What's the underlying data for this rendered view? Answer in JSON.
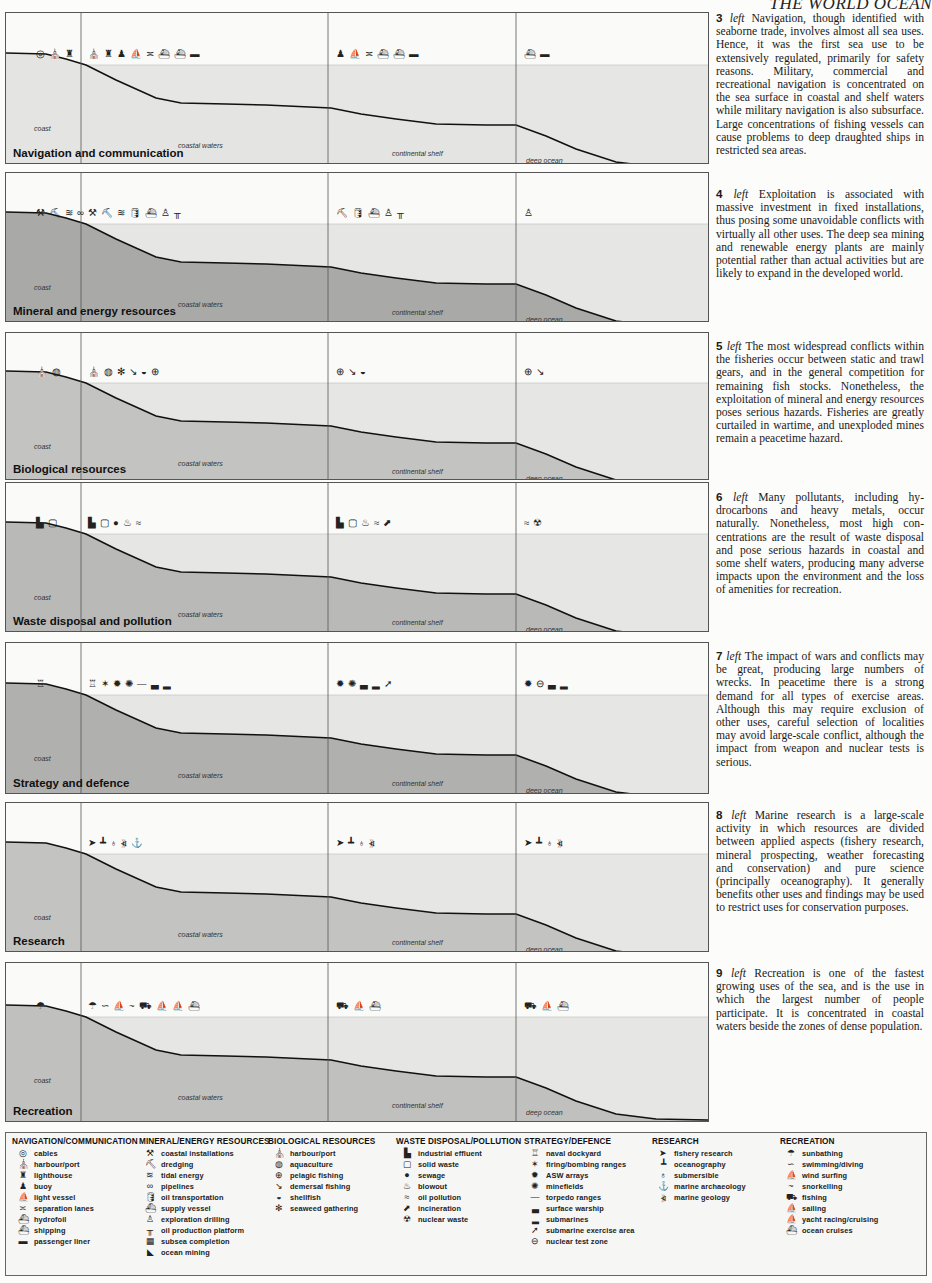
{
  "running_head": "THE WORLD OCEAN",
  "zones": {
    "coast": "coast",
    "coastal_waters": "coastal waters",
    "continental_shelf": "continental shelf",
    "deep_ocean": "deep ocean"
  },
  "panels": [
    {
      "title": "Navigation and communication",
      "seabed": "#f0f0ee"
    },
    {
      "title": "Mineral and energy resources",
      "seabed": "#a9a9a7"
    },
    {
      "title": "Biological resources",
      "seabed": "#c3c3c1"
    },
    {
      "title": "Waste disposal and pollution",
      "seabed": "#b9b9b7"
    },
    {
      "title": "Strategy and defence",
      "seabed": "#b0b0ae"
    },
    {
      "title": "Research",
      "seabed": "#c3c3c1"
    },
    {
      "title": "Recreation",
      "seabed": "#c0c0be"
    }
  ],
  "captions": [
    {
      "num": "3",
      "dir": "left",
      "text": "Navigation, though identified with seaborne trade, involves almost all sea uses. Hence, it was the first sea use to be extensively regulated, primarily for safety reasons. Military, commercial and recreational naviga­tion is concentrated on the sea surface in coastal and shelf waters while mili­tary navigation is also subsurface. Large concentrations of fishing vessels can cause problems to deep draughted ships in restricted sea areas."
    },
    {
      "num": "4",
      "dir": "left",
      "text": "Exploitation is associated with massive investment in fixed installa­tions, thus posing some unavoidable conflicts with virtually all other uses. The deep sea mining and renewable energy plants are mainly potential rather than actual activities but are likely to expand in the developed world."
    },
    {
      "num": "5",
      "dir": "left",
      "text": "The most widespread conflicts within the fisheries occur between static and trawl gears, and in the gen­eral competition for remaining fish stocks. Nonetheless, the exploitation of mineral and energy resources poses serious hazards. Fisheries are greatly curtailed in wartime, and unexploded mines remain a peacetime hazard."
    },
    {
      "num": "6",
      "dir": "left",
      "text": "Many pollutants, including hy­drocarbons and heavy metals, occur naturally. Nonetheless, most high con­centrations are the result of waste disposal and pose serious hazards in coastal and some shelf waters, produc­ing many adverse impacts upon the en­vironment and the loss of amenities for recreation."
    },
    {
      "num": "7",
      "dir": "left",
      "text": "The impact of wars and conflicts may be great, producing large numbers of wrecks. In peacetime there is a strong demand for all types of exercise areas. Although this may require exclu­sion of other uses, careful selection of localities may avoid large-scale conflict, although the impact from weapon and nuclear tests is serious."
    },
    {
      "num": "8",
      "dir": "left",
      "text": "Marine research is a large-scale activity in which resources are divided between applied aspects (fishery re­search, mineral prospecting, weather forecasting and conservation) and pure science (principally oceanography). It generally benefits other uses and find­ings may be used to restrict uses for conservation purposes."
    },
    {
      "num": "9",
      "dir": "left",
      "text": "Recreation is one of the fastest growing uses of the sea, and is the use in which the largest number of people participate. It is concentrated in coastal waters beside the zones of dense popu­lation."
    }
  ],
  "legend": [
    {
      "heading": "NAVIGATION/COMMUNICATION",
      "items": [
        {
          "icon": "cable-reel-icon",
          "label": "cables"
        },
        {
          "icon": "harbour-icon",
          "label": "harbour/port"
        },
        {
          "icon": "lighthouse-icon",
          "label": "lighthouse"
        },
        {
          "icon": "buoy-icon",
          "label": "buoy"
        },
        {
          "icon": "light-vessel-icon",
          "label": "light vessel"
        },
        {
          "icon": "separation-lanes-icon",
          "label": "separation lanes"
        },
        {
          "icon": "hydrofoil-icon",
          "label": "hydrofoil"
        },
        {
          "icon": "shipping-icon",
          "label": "shipping"
        },
        {
          "icon": "passenger-liner-icon",
          "label": "passenger liner"
        }
      ]
    },
    {
      "heading": "MINERAL/ENERGY RESOURCES",
      "items": [
        {
          "icon": "crane-icon",
          "label": "coastal installations"
        },
        {
          "icon": "dredger-icon",
          "label": "dredging"
        },
        {
          "icon": "tidal-icon",
          "label": "tidal energy"
        },
        {
          "icon": "pipeline-icon",
          "label": "pipelines"
        },
        {
          "icon": "oil-transport-icon",
          "label": "oil transportation"
        },
        {
          "icon": "supply-vessel-icon",
          "label": "supply vessel"
        },
        {
          "icon": "drill-rig-icon",
          "label": "exploration drilling"
        },
        {
          "icon": "platform-icon",
          "label": "oil production platform"
        },
        {
          "icon": "subsea-icon",
          "label": "subsea completion"
        },
        {
          "icon": "mining-icon",
          "label": "ocean mining"
        }
      ]
    },
    {
      "heading": "BIOLOGICAL RESOURCES",
      "items": [
        {
          "icon": "harbour-icon",
          "label": "harbour/port"
        },
        {
          "icon": "shell-icon",
          "label": "aquaculture"
        },
        {
          "icon": "net-icon",
          "label": "pelagic fishing"
        },
        {
          "icon": "trawl-icon",
          "label": "demersal fishing"
        },
        {
          "icon": "shellfish-icon",
          "label": "shellfish"
        },
        {
          "icon": "seaweed-icon",
          "label": "seaweed gathering"
        }
      ]
    },
    {
      "heading": "WASTE DISPOSAL/POLLUTION",
      "items": [
        {
          "icon": "factory-icon",
          "label": "industrial effluent"
        },
        {
          "icon": "waste-bag-icon",
          "label": "solid waste"
        },
        {
          "icon": "sewage-icon",
          "label": "sewage"
        },
        {
          "icon": "blowout-icon",
          "label": "blowout"
        },
        {
          "icon": "oil-slick-icon",
          "label": "oil pollution"
        },
        {
          "icon": "incineration-icon",
          "label": "incineration"
        },
        {
          "icon": "radiation-icon",
          "label": "nuclear waste"
        }
      ]
    },
    {
      "heading": "STRATEGY/DEFENCE",
      "items": [
        {
          "icon": "dockyard-icon",
          "label": "naval dockyard"
        },
        {
          "icon": "explosion-icon",
          "label": "firing/bombing ranges"
        },
        {
          "icon": "asw-icon",
          "label": "ASW arrays"
        },
        {
          "icon": "mine-icon",
          "label": "minefields"
        },
        {
          "icon": "torpedo-icon",
          "label": "torpedo ranges"
        },
        {
          "icon": "warship-icon",
          "label": "surface warship"
        },
        {
          "icon": "submarine-icon",
          "label": "submarines"
        },
        {
          "icon": "sub-exercise-icon",
          "label": "submarine exercise area"
        },
        {
          "icon": "nuclear-test-icon",
          "label": "nuclear test zone"
        }
      ]
    },
    {
      "heading": "RESEARCH",
      "items": [
        {
          "icon": "fish-icon",
          "label": "fishery research"
        },
        {
          "icon": "research-ship-icon",
          "label": "oceanography"
        },
        {
          "icon": "submersible-icon",
          "label": "submersible"
        },
        {
          "icon": "wreck-icon",
          "label": "marine archaeology"
        },
        {
          "icon": "sonar-icon",
          "label": "marine geology"
        }
      ]
    },
    {
      "heading": "RECREATION",
      "items": [
        {
          "icon": "umbrella-icon",
          "label": "sunbathing"
        },
        {
          "icon": "swimmer-icon",
          "label": "swimming/diving"
        },
        {
          "icon": "windsurf-icon",
          "label": "wind surfing"
        },
        {
          "icon": "snorkel-icon",
          "label": "snorkelling"
        },
        {
          "icon": "fishing-boat-icon",
          "label": "fishing"
        },
        {
          "icon": "sail-icon",
          "label": "sailing"
        },
        {
          "icon": "yacht-icon",
          "label": "yacht racing/cruising"
        },
        {
          "icon": "cruise-icon",
          "label": "ocean cruises"
        }
      ]
    }
  ],
  "glyphs": {
    "cable-reel-icon": "◎",
    "harbour-icon": "⛪",
    "lighthouse-icon": "♜",
    "buoy-icon": "♟",
    "light-vessel-icon": "⛵",
    "separation-lanes-icon": "≍",
    "hydrofoil-icon": "⛴",
    "shipping-icon": "⛴",
    "passenger-liner-icon": "▬",
    "crane-icon": "⚒",
    "dredger-icon": "⛏",
    "tidal-icon": "≋",
    "pipeline-icon": "∞",
    "oil-transport-icon": "🛢",
    "supply-vessel-icon": "⛴",
    "drill-rig-icon": "♙",
    "platform-icon": "╥",
    "subsea-icon": "▦",
    "mining-icon": "◣",
    "shell-icon": "◍",
    "net-icon": "⊕",
    "trawl-icon": "↘",
    "shellfish-icon": "◒",
    "seaweed-icon": "✻",
    "factory-icon": "▙",
    "waste-bag-icon": "▢",
    "sewage-icon": "●",
    "blowout-icon": "♨",
    "oil-slick-icon": "≈",
    "incineration-icon": "⬈",
    "radiation-icon": "☢",
    "dockyard-icon": "♖",
    "explosion-icon": "✶",
    "asw-icon": "✹",
    "mine-icon": "✺",
    "torpedo-icon": "—",
    "warship-icon": "▃",
    "submarine-icon": "▂",
    "sub-exercise-icon": "➚",
    "nuclear-test-icon": "⊖",
    "fish-icon": "➤",
    "research-ship-icon": "┻",
    "submersible-icon": "♁",
    "wreck-icon": "⚓",
    "sonar-icon": "⦖",
    "umbrella-icon": "☂",
    "swimmer-icon": "∽",
    "windsurf-icon": "⛵",
    "snorkel-icon": "~",
    "fishing-boat-icon": "⛟",
    "sail-icon": "⛵",
    "yacht-icon": "⛵",
    "cruise-icon": "⛴"
  },
  "panel_icons": [
    {
      "coast": [
        "cable-reel-icon",
        "harbour-icon",
        "lighthouse-icon"
      ],
      "coastal": [
        "harbour-icon",
        "lighthouse-icon",
        "buoy-icon",
        "light-vessel-icon",
        "separation-lanes-icon",
        "hydrofoil-icon",
        "shipping-icon",
        "passenger-liner-icon"
      ],
      "shelf": [
        "buoy-icon",
        "light-vessel-icon",
        "separation-lanes-icon",
        "hydrofoil-icon",
        "shipping-icon",
        "passenger-liner-icon"
      ],
      "deep": [
        "shipping-icon",
        "passenger-liner-icon"
      ]
    },
    {
      "coast": [
        "crane-icon",
        "dredger-icon",
        "tidal-icon",
        "pipeline-icon"
      ],
      "coastal": [
        "crane-icon",
        "dredger-icon",
        "tidal-icon",
        "oil-transport-icon",
        "supply-vessel-icon",
        "drill-rig-icon",
        "platform-icon"
      ],
      "shelf": [
        "dredger-icon",
        "oil-transport-icon",
        "supply-vessel-icon",
        "drill-rig-icon",
        "platform-icon"
      ],
      "deep": [
        "drill-rig-icon"
      ]
    },
    {
      "coast": [
        "harbour-icon",
        "shell-icon"
      ],
      "coastal": [
        "harbour-icon",
        "shell-icon",
        "seaweed-icon",
        "trawl-icon",
        "shellfish-icon",
        "net-icon"
      ],
      "shelf": [
        "net-icon",
        "trawl-icon",
        "shellfish-icon"
      ],
      "deep": [
        "net-icon",
        "trawl-icon"
      ]
    },
    {
      "coast": [
        "factory-icon",
        "waste-bag-icon"
      ],
      "coastal": [
        "factory-icon",
        "waste-bag-icon",
        "sewage-icon",
        "blowout-icon",
        "oil-slick-icon"
      ],
      "shelf": [
        "factory-icon",
        "waste-bag-icon",
        "blowout-icon",
        "oil-slick-icon",
        "incineration-icon"
      ],
      "deep": [
        "oil-slick-icon",
        "radiation-icon"
      ]
    },
    {
      "coast": [
        "dockyard-icon"
      ],
      "coastal": [
        "dockyard-icon",
        "explosion-icon",
        "asw-icon",
        "mine-icon",
        "torpedo-icon",
        "warship-icon",
        "submarine-icon"
      ],
      "shelf": [
        "asw-icon",
        "mine-icon",
        "warship-icon",
        "submarine-icon",
        "sub-exercise-icon"
      ],
      "deep": [
        "asw-icon",
        "nuclear-test-icon",
        "warship-icon",
        "submarine-icon"
      ]
    },
    {
      "coast": [],
      "coastal": [
        "fish-icon",
        "research-ship-icon",
        "submersible-icon",
        "sonar-icon",
        "wreck-icon"
      ],
      "shelf": [
        "fish-icon",
        "research-ship-icon",
        "submersible-icon",
        "sonar-icon"
      ],
      "deep": [
        "fish-icon",
        "research-ship-icon",
        "submersible-icon",
        "sonar-icon"
      ]
    },
    {
      "coast": [
        "umbrella-icon"
      ],
      "coastal": [
        "umbrella-icon",
        "swimmer-icon",
        "windsurf-icon",
        "snorkel-icon",
        "fishing-boat-icon",
        "sail-icon",
        "yacht-icon",
        "cruise-icon"
      ],
      "shelf": [
        "fishing-boat-icon",
        "yacht-icon",
        "cruise-icon"
      ],
      "deep": [
        "fishing-boat-icon",
        "yacht-icon",
        "cruise-icon"
      ]
    }
  ]
}
